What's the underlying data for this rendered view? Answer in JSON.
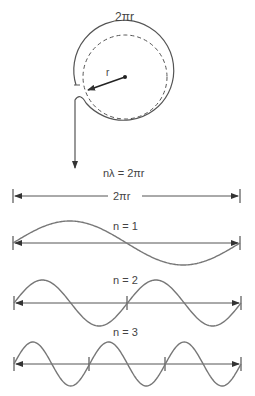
{
  "diagram": {
    "circle": {
      "circumference_label": "2πr",
      "radius_label": "r"
    },
    "relation": "nλ = 2πr",
    "length_label": "2πr",
    "waves": [
      {
        "label": "n = 1",
        "n": 1
      },
      {
        "label": "n = 2",
        "n": 2
      },
      {
        "label": "n = 3",
        "n": 3
      }
    ],
    "colors": {
      "stroke": "#555555",
      "text": "#444444"
    }
  }
}
